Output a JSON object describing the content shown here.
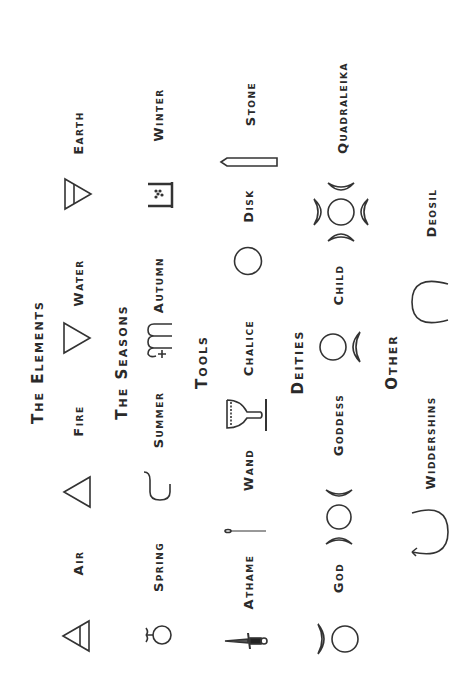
{
  "sections": [
    {
      "heading": "The Elements",
      "items": [
        {
          "label": "Air",
          "icon": "air-triangle-icon"
        },
        {
          "label": "Fire",
          "icon": "fire-triangle-icon"
        },
        {
          "label": "Water",
          "icon": "water-triangle-icon"
        },
        {
          "label": "Earth",
          "icon": "earth-triangle-icon"
        }
      ]
    },
    {
      "heading": "The Seasons",
      "items": [
        {
          "label": "Spring",
          "icon": "spring-symbol-icon"
        },
        {
          "label": "Summer",
          "icon": "summer-symbol-icon"
        },
        {
          "label": "Autumn",
          "icon": "autumn-symbol-icon"
        },
        {
          "label": "Winter",
          "icon": "winter-symbol-icon"
        }
      ]
    },
    {
      "heading": "Tools",
      "items": [
        {
          "label": "Athame",
          "icon": "athame-dagger-icon"
        },
        {
          "label": "Wand",
          "icon": "wand-icon"
        },
        {
          "label": "Chalice",
          "icon": "chalice-icon"
        },
        {
          "label": "Disk",
          "icon": "disk-circle-icon"
        },
        {
          "label": "Stone",
          "icon": "stone-icon"
        }
      ]
    },
    {
      "heading": "Deities",
      "items": [
        {
          "label": "God",
          "icon": "horned-god-icon"
        },
        {
          "label": "Goddess",
          "icon": "triple-moon-icon"
        },
        {
          "label": "Child",
          "icon": "child-moon-icon"
        },
        {
          "label": "Quadraleika",
          "icon": "quadraleika-icon"
        }
      ]
    },
    {
      "heading": "Other",
      "items": [
        {
          "label": "Widdershins",
          "icon": "widdershins-arrow-icon"
        },
        {
          "label": "Deosil",
          "icon": "deosil-arrow-icon"
        }
      ]
    }
  ]
}
